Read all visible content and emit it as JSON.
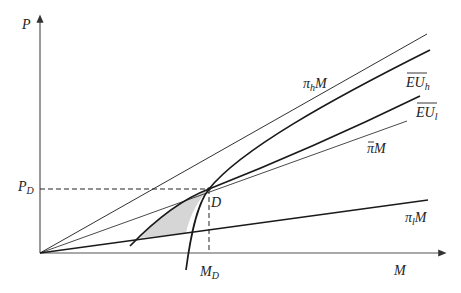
{
  "diagram": {
    "axes": {
      "y_label": "P",
      "x_label": "M"
    },
    "point": {
      "label": "D",
      "x_label": "M",
      "x_label_sub": "D",
      "y_label": "P",
      "y_label_sub": "D"
    },
    "lines": {
      "pi_h": {
        "label": "π",
        "sub": "h",
        "suffix": "M"
      },
      "eu_h": {
        "label": "EU",
        "sub": "h"
      },
      "eu_l": {
        "label": "EU",
        "sub": "l"
      },
      "pi_bar": {
        "label": "π",
        "suffix": "M"
      },
      "pi_l": {
        "label": "π",
        "sub": "l",
        "suffix": "M"
      }
    },
    "colors": {
      "line": "#1a1a1a",
      "axis": "#555555",
      "shade": "#d6d6d6"
    }
  }
}
